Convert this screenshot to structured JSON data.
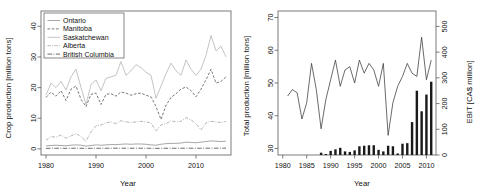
{
  "figure": {
    "background": "#ffffff",
    "axis_color": "#5a5a5a",
    "panels": 2
  },
  "chart_data": [
    {
      "id": "left-panel",
      "type": "line",
      "title": "",
      "xlabel": "Year",
      "ylabel": "Crop production [million tons]",
      "xlim": [
        1979,
        2017
      ],
      "ylim": [
        -2,
        45
      ],
      "xticks": [
        1980,
        1990,
        2000,
        2010
      ],
      "yticks": [
        0,
        10,
        20,
        30,
        40
      ],
      "grid": false,
      "legend_position": "top-left",
      "x": [
        1980,
        1981,
        1982,
        1983,
        1984,
        1985,
        1986,
        1987,
        1988,
        1989,
        1990,
        1991,
        1992,
        1993,
        1994,
        1995,
        1996,
        1997,
        1998,
        1999,
        2000,
        2001,
        2002,
        2003,
        2004,
        2005,
        2006,
        2007,
        2008,
        2009,
        2010,
        2011,
        2012,
        2013,
        2014,
        2015,
        2016
      ],
      "series": [
        {
          "name": "Ontario",
          "linestyle": "solid",
          "color": "#8a8a8a",
          "values": [
            1.0,
            1.1,
            1.2,
            1.1,
            1.0,
            1.2,
            1.3,
            1.2,
            0.9,
            1.1,
            1.3,
            1.2,
            1.3,
            1.4,
            1.4,
            1.5,
            1.6,
            1.5,
            1.6,
            1.6,
            1.5,
            1.3,
            1.2,
            1.5,
            1.7,
            1.8,
            1.8,
            1.9,
            2.2,
            2.1,
            2.0,
            2.2,
            2.4,
            2.6,
            2.5,
            2.4,
            2.5
          ]
        },
        {
          "name": "Manitoba",
          "linestyle": "dashed",
          "color": "#4a4a4a",
          "values": [
            16.8,
            18.5,
            17.2,
            19.0,
            15.8,
            19.5,
            20.5,
            16.2,
            13.8,
            17.8,
            18.2,
            14.5,
            17.8,
            18.0,
            17.2,
            18.6,
            18.2,
            17.5,
            18.0,
            18.2,
            17.5,
            17.0,
            13.8,
            9.6,
            14.2,
            16.8,
            18.0,
            19.5,
            20.2,
            19.0,
            17.0,
            19.5,
            22.5,
            26.0,
            21.5,
            22.0,
            23.5
          ]
        },
        {
          "name": "Saskatchewan",
          "linestyle": "solid",
          "color": "#b0b0b0",
          "values": [
            17.5,
            21.5,
            20.0,
            22.0,
            19.2,
            23.5,
            26.0,
            20.0,
            14.5,
            21.0,
            22.5,
            19.0,
            23.0,
            23.5,
            24.0,
            28.5,
            24.0,
            25.5,
            27.5,
            26.5,
            25.0,
            24.0,
            16.5,
            20.5,
            24.5,
            28.0,
            25.5,
            24.0,
            29.0,
            26.0,
            24.0,
            26.0,
            30.5,
            37.0,
            32.0,
            33.5,
            30.0
          ]
        },
        {
          "name": "Alberta",
          "linestyle": "dashdot",
          "color": "#9a9a9a",
          "values": [
            2.8,
            4.0,
            3.8,
            4.5,
            3.5,
            4.2,
            5.0,
            4.0,
            2.5,
            5.5,
            7.5,
            7.8,
            8.5,
            8.8,
            8.2,
            9.2,
            8.8,
            8.6,
            8.8,
            9.0,
            8.8,
            8.5,
            5.8,
            7.8,
            8.2,
            9.2,
            8.8,
            9.0,
            10.2,
            9.5,
            8.2,
            6.2,
            8.5,
            9.0,
            8.8,
            8.6,
            9.0
          ]
        },
        {
          "name": "British Columbia",
          "linestyle": "longdashdot",
          "color": "#3a3a3a",
          "values": [
            0.18,
            0.19,
            0.2,
            0.19,
            0.18,
            0.2,
            0.21,
            0.2,
            0.15,
            0.19,
            0.2,
            0.2,
            0.21,
            0.22,
            0.21,
            0.22,
            0.22,
            0.21,
            0.22,
            0.22,
            0.21,
            0.2,
            0.16,
            0.19,
            0.2,
            0.21,
            0.2,
            0.21,
            0.22,
            0.21,
            0.2,
            0.21,
            0.22,
            0.23,
            0.22,
            0.22,
            0.23
          ]
        }
      ]
    },
    {
      "id": "right-panel",
      "type": "line+bar",
      "title": "",
      "xlabel": "Year",
      "ylabel": "Total production [million tons]",
      "y2label": "EBIT [CA$ million]",
      "xlim": [
        1979,
        2012
      ],
      "ylim": [
        28,
        72
      ],
      "y2lim": [
        0,
        560
      ],
      "xticks": [
        1980,
        1985,
        1990,
        1995,
        2000,
        2005,
        2010
      ],
      "yticks": [
        30,
        40,
        50,
        60,
        70
      ],
      "y2ticks": [
        0,
        100,
        200,
        300,
        400,
        500
      ],
      "grid": false,
      "line_series": {
        "name": "Total production",
        "linestyle": "solid",
        "color": "#3a3a3a",
        "x": [
          1981,
          1982,
          1983,
          1984,
          1985,
          1986,
          1987,
          1988,
          1989,
          1990,
          1991,
          1992,
          1993,
          1994,
          1995,
          1996,
          1997,
          1998,
          1999,
          2000,
          2001,
          2002,
          2003,
          2004,
          2005,
          2006,
          2007,
          2008,
          2009,
          2010,
          2011
        ],
        "values": [
          46,
          48,
          47,
          39,
          44,
          56,
          48,
          36,
          45,
          51,
          57,
          49,
          54,
          55,
          50,
          57,
          53,
          56,
          54,
          49,
          56,
          34,
          44,
          49,
          52,
          56,
          53,
          52,
          64,
          51,
          57
        ]
      },
      "bar_series": {
        "name": "EBIT",
        "color": "#1a1a1a",
        "x": [
          1988,
          1989,
          1990,
          1991,
          1992,
          1993,
          1994,
          1995,
          1996,
          1997,
          1998,
          1999,
          2000,
          2001,
          2002,
          2003,
          2004,
          2005,
          2006,
          2007,
          2008,
          2009,
          2010,
          2011
        ],
        "values": [
          9,
          4,
          16,
          22,
          28,
          14,
          12,
          18,
          34,
          36,
          38,
          38,
          20,
          14,
          36,
          34,
          6,
          44,
          46,
          128,
          250,
          170,
          235,
          285,
          275,
          470
        ]
      }
    }
  ],
  "left_panel": {
    "ylabel": "Crop production [million tons]",
    "xlabel": "Year",
    "yticks": [
      "0",
      "10",
      "20",
      "30",
      "40"
    ],
    "xticks": [
      "1980",
      "1990",
      "2000",
      "2010"
    ],
    "legend": [
      {
        "label": "Ontario"
      },
      {
        "label": "Manitoba"
      },
      {
        "label": "Saskatchewan"
      },
      {
        "label": "Alberta"
      },
      {
        "label": "British Columbia"
      }
    ]
  },
  "right_panel": {
    "ylabel": "Total production [million tons]",
    "y2label": "EBIT [CA$ million]",
    "xlabel": "Year",
    "yticks": [
      "30",
      "40",
      "50",
      "60",
      "70"
    ],
    "y2ticks": [
      "0",
      "100",
      "200",
      "300",
      "400",
      "500"
    ],
    "xticks": [
      "1980",
      "1985",
      "1990",
      "1995",
      "2000",
      "2005",
      "2010"
    ]
  }
}
